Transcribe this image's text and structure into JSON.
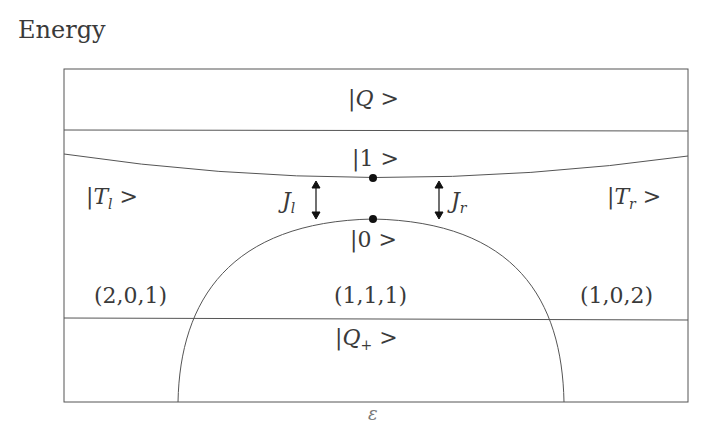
{
  "axis": {
    "y_label": "Energy",
    "x_label": "ε"
  },
  "states": {
    "Q": {
      "bar": "|",
      "sym": "Q",
      "ket": " >"
    },
    "Qplus": {
      "bar": "|",
      "sym": "Q",
      "sub": "+",
      "ket": " >"
    },
    "one": {
      "text": "|1 >"
    },
    "zero": {
      "text": "|0 >"
    },
    "Tl": {
      "bar": "|",
      "sym": "T",
      "sub": "l",
      "ket": " >"
    },
    "Tr": {
      "bar": "|",
      "sym": "T",
      "sub": "r",
      "ket": " >"
    }
  },
  "couplings": {
    "Jl": {
      "sym": "J",
      "sub": "l"
    },
    "Jr": {
      "sym": "J",
      "sub": "r"
    }
  },
  "regions": {
    "left": "(2,0,1)",
    "center": "(1,1,1)",
    "right": "(1,0,2)"
  },
  "colors": {
    "line": "#555555",
    "text": "#3a3a3a",
    "dot": "#111111"
  }
}
